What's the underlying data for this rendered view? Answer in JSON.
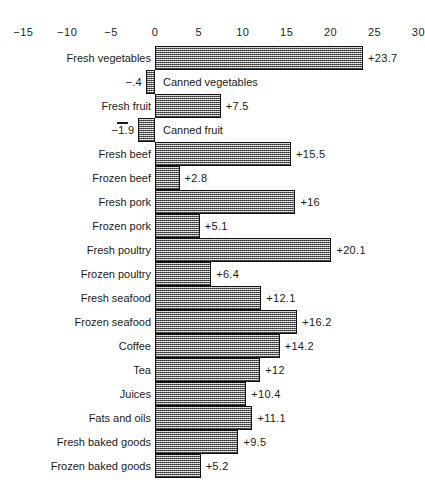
{
  "chart_data": {
    "type": "bar",
    "orientation": "horizontal",
    "title": "",
    "subtitle": "",
    "xlabel": "",
    "ylabel": "",
    "xlim": [
      -15,
      30
    ],
    "xticks": [
      -15,
      -10,
      -5,
      0,
      5,
      10,
      15,
      20,
      25,
      30
    ],
    "xtick_labels": [
      "−15",
      "−10",
      "−5",
      "0",
      "5",
      "10",
      "15",
      "20",
      "25",
      "30"
    ],
    "grid": false,
    "legend": null,
    "baseline": 0,
    "categories": [
      "Fresh vegetables",
      "Canned vegetables",
      "Fresh fruit",
      "Canned fruit",
      "Fresh beef",
      "Frozen beef",
      "Fresh pork",
      "Frozen pork",
      "Fresh poultry",
      "Frozen poultry",
      "Fresh seafood",
      "Frozen seafood",
      "Coffee",
      "Tea",
      "Juices",
      "Fats and oils",
      "Fresh baked goods",
      "Frozen baked goods"
    ],
    "values": [
      23.7,
      -0.4,
      7.5,
      -1.9,
      15.5,
      2.8,
      16,
      5.1,
      20.1,
      6.4,
      12.1,
      16.2,
      14.2,
      12,
      10.4,
      11.1,
      9.5,
      5.2
    ],
    "value_labels": [
      "+23.7",
      "−.4",
      "+7.5",
      "−1.9",
      "+15.5",
      "+2.8",
      "+16",
      "+5.1",
      "+20.1",
      "+6.4",
      "+12.1",
      "+16.2",
      "+14.2",
      "+12",
      "+10.4",
      "+11.1",
      "+9.5",
      "+5.2"
    ],
    "colors": {
      "bar_fill": "#a8a8a8",
      "bar_border": "#111111",
      "text": "#1a1a1a",
      "background": "#ffffff"
    }
  },
  "rows": [
    {
      "label": "Fresh vegetables",
      "value": 23.7,
      "value_label": "+23.7",
      "sign": "pos"
    },
    {
      "label": "Canned vegetables",
      "value": -0.4,
      "value_label": "−.4",
      "sign": "neg"
    },
    {
      "label": "Fresh fruit",
      "value": 7.5,
      "value_label": "+7.5",
      "sign": "pos"
    },
    {
      "label": "Canned fruit",
      "value": -1.9,
      "value_label": "−1.9",
      "sign": "neg"
    },
    {
      "label": "Fresh beef",
      "value": 15.5,
      "value_label": "+15.5",
      "sign": "pos"
    },
    {
      "label": "Frozen beef",
      "value": 2.8,
      "value_label": "+2.8",
      "sign": "pos"
    },
    {
      "label": "Fresh pork",
      "value": 16,
      "value_label": "+16",
      "sign": "pos"
    },
    {
      "label": "Frozen pork",
      "value": 5.1,
      "value_label": "+5.1",
      "sign": "pos"
    },
    {
      "label": "Fresh poultry",
      "value": 20.1,
      "value_label": "+20.1",
      "sign": "pos"
    },
    {
      "label": "Frozen poultry",
      "value": 6.4,
      "value_label": "+6.4",
      "sign": "pos"
    },
    {
      "label": "Fresh seafood",
      "value": 12.1,
      "value_label": "+12.1",
      "sign": "pos"
    },
    {
      "label": "Frozen seafood",
      "value": 16.2,
      "value_label": "+16.2",
      "sign": "pos"
    },
    {
      "label": "Coffee",
      "value": 14.2,
      "value_label": "+14.2",
      "sign": "pos"
    },
    {
      "label": "Tea",
      "value": 12,
      "value_label": "+12",
      "sign": "pos"
    },
    {
      "label": "Juices",
      "value": 10.4,
      "value_label": "+10.4",
      "sign": "pos"
    },
    {
      "label": "Fats and oils",
      "value": 11.1,
      "value_label": "+11.1",
      "sign": "pos"
    },
    {
      "label": "Fresh baked goods",
      "value": 9.5,
      "value_label": "+9.5",
      "sign": "pos"
    },
    {
      "label": "Frozen baked goods",
      "value": 5.2,
      "value_label": "+5.2",
      "sign": "pos"
    }
  ],
  "axis": {
    "ticks": [
      "−15",
      "−10",
      "−5",
      "0",
      "5",
      "10",
      "15",
      "20",
      "25",
      "30"
    ],
    "tick_values": [
      -15,
      -10,
      -5,
      0,
      5,
      10,
      15,
      20,
      25,
      30
    ]
  }
}
